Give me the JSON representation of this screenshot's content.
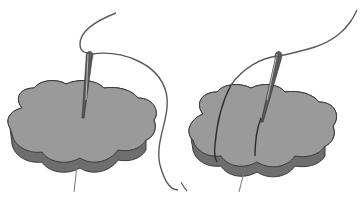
{
  "figure": {
    "panels": [
      {
        "step": 1,
        "label": "Needle inserted through fabric, thread trailing"
      },
      {
        "step": 2,
        "label": "Thread wrapped over edge, needle inserted again"
      }
    ]
  },
  "colors": {
    "background": "#ffffff",
    "fabric_top": "#9a9a9a",
    "fabric_side": "#6e6e6e",
    "outline": "#3a3a3a",
    "thread": "#5a5a5a",
    "needle": "#4a4a4a"
  }
}
